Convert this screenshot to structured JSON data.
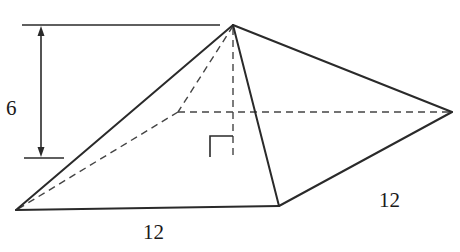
{
  "figure": {
    "type": "square pyramid",
    "labels": {
      "height": "6",
      "base_front_edge": "12",
      "base_right_edge": "12"
    },
    "right_angle_marker": true,
    "colors": {
      "line": "#2a2a2a",
      "dashed": "#444444",
      "background": "#ffffff"
    }
  }
}
